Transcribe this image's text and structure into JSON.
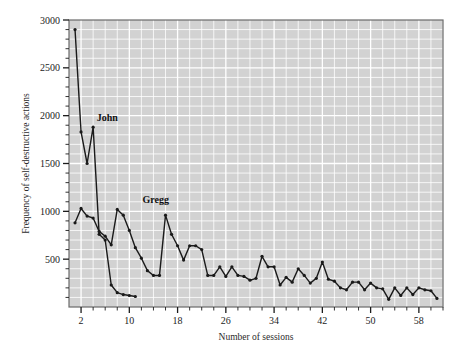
{
  "chart_data": {
    "type": "line",
    "title": "",
    "xlabel": "Number of sessions",
    "ylabel": "Frequency of self-destructive actions",
    "xlim": [
      0,
      62
    ],
    "ylim": [
      0,
      3000
    ],
    "xticks_labeled": [
      2,
      10,
      18,
      26,
      34,
      42,
      50,
      58
    ],
    "xtick_step_minor": 2,
    "yticks_labeled": [
      500,
      1000,
      1500,
      2000,
      2500,
      3000
    ],
    "ytick_step_minor": 100,
    "grid": true,
    "grid_color": "#ffffff",
    "plot_background": "#d2d2d2",
    "series_color": "#1a1a1a",
    "legend": "inline-annotations",
    "annotations": [
      {
        "text": "John",
        "x": 4.6,
        "y": 1940
      },
      {
        "text": "Gregg",
        "x": 12.2,
        "y": 1090
      }
    ],
    "series": [
      {
        "name": "John",
        "label_x": 4.6,
        "label_y": 1940,
        "x": [
          1,
          2,
          3,
          4,
          5,
          6,
          7,
          8,
          9,
          10,
          11
        ],
        "values": [
          2900,
          1830,
          1500,
          1880,
          760,
          700,
          230,
          150,
          130,
          120,
          110
        ]
      },
      {
        "name": "Gregg",
        "label_x": 12.2,
        "label_y": 1090,
        "x": [
          1,
          2,
          3,
          4,
          5,
          6,
          7,
          8,
          9,
          10,
          11,
          12,
          13,
          14,
          15,
          16,
          17,
          18,
          19,
          20,
          21,
          22,
          23,
          24,
          25,
          26,
          27,
          28,
          29,
          30,
          31,
          32,
          33,
          34,
          35,
          36,
          37,
          38,
          39,
          40,
          41,
          42,
          43,
          44,
          45,
          46,
          47,
          48,
          49,
          50,
          51,
          52,
          53,
          54,
          55,
          56,
          57,
          58,
          59,
          60,
          61
        ],
        "values": [
          880,
          1030,
          950,
          930,
          790,
          740,
          650,
          1020,
          960,
          800,
          620,
          510,
          380,
          330,
          330,
          960,
          760,
          640,
          490,
          640,
          640,
          600,
          330,
          330,
          420,
          320,
          420,
          330,
          320,
          280,
          300,
          530,
          420,
          420,
          230,
          310,
          260,
          400,
          330,
          250,
          300,
          470,
          290,
          270,
          200,
          180,
          260,
          260,
          180,
          250,
          200,
          190,
          80,
          200,
          120,
          200,
          130,
          200,
          180,
          170,
          90
        ]
      }
    ]
  }
}
